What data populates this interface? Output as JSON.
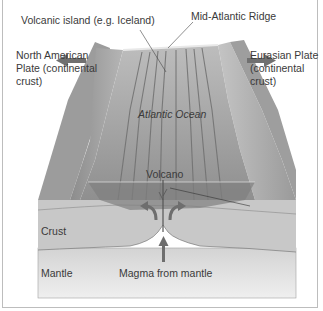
{
  "diagram": {
    "labels": {
      "volcanic_island": "Volcanic island (e.g. Iceland)",
      "mid_atlantic_ridge": "Mid-Atlantic Ridge",
      "north_american_plate_line1": "North American",
      "north_american_plate_line2": "Plate (continental",
      "north_american_plate_line3": "crust)",
      "eurasian_plate_line1": "Eurasian Plate",
      "eurasian_plate_line2": "(continental",
      "eurasian_plate_line3": "crust)",
      "atlantic_ocean": "Atlantic Ocean",
      "volcano": "Volcano",
      "crust": "Crust",
      "mantle": "Mantle",
      "magma": "Magma from mantle"
    },
    "arrows": {
      "north_american": "left",
      "eurasian": "right",
      "magma": "up",
      "convection": [
        "curve-left",
        "curve-right"
      ]
    },
    "colors": {
      "plate_top": "#9a9a9a",
      "ocean_floor": "#a8a8a8",
      "crust": "#c9c9c9",
      "mantle": "#dcdcdc",
      "arrow": "#707070",
      "frame": "#bdbdbd"
    }
  }
}
